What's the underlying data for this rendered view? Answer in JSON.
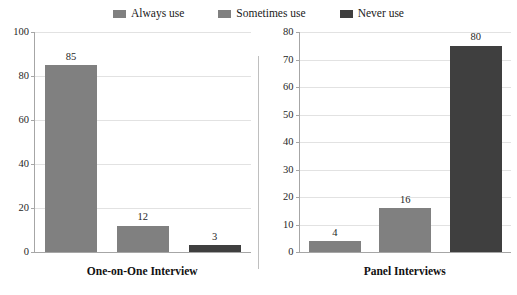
{
  "legend": {
    "items": [
      {
        "label": "Always use",
        "color": "#808080",
        "icon": "legend-swatch-icon"
      },
      {
        "label": "Sometimes use",
        "color": "#808080",
        "icon": "legend-swatch-icon"
      },
      {
        "label": "Never use",
        "color": "#3f3f3f",
        "icon": "legend-swatch-icon"
      }
    ]
  },
  "chart_data": [
    {
      "type": "bar",
      "title": "One-on-One Interview",
      "categories": [
        "Always use",
        "Sometimes use",
        "Never use"
      ],
      "values": [
        85,
        12,
        3
      ],
      "colors": [
        "#808080",
        "#808080",
        "#3f3f3f"
      ],
      "xlabel": "",
      "ylabel": "",
      "ylim": [
        0,
        100
      ],
      "ytick_step": 20,
      "yticks": [
        0,
        20,
        40,
        60,
        80,
        100
      ],
      "ytick_labels": [
        "0",
        "20",
        "40",
        "60",
        "80",
        "100"
      ],
      "data_labels": [
        "85",
        "12",
        "3"
      ],
      "grid": true,
      "legend_position": "top-center"
    },
    {
      "type": "bar",
      "title": "Panel Interviews",
      "categories": [
        "Always use",
        "Sometimes use",
        "Never use"
      ],
      "values": [
        4,
        16,
        80
      ],
      "colors": [
        "#808080",
        "#808080",
        "#3f3f3f"
      ],
      "xlabel": "",
      "ylabel": "",
      "ylim": [
        0,
        80
      ],
      "ytick_step": 10,
      "yticks": [
        0,
        10,
        20,
        30,
        40,
        50,
        60,
        70,
        80
      ],
      "ytick_labels": [
        "0",
        "10",
        "20",
        "30",
        "40",
        "50",
        "60",
        "70",
        "80"
      ],
      "data_labels": [
        "4",
        "16",
        "80"
      ],
      "grid": true,
      "legend_position": "top-center"
    }
  ],
  "colors": {
    "series_light": "#808080",
    "series_dark": "#3f3f3f",
    "gridline": "#e2e2e2",
    "axis": "#a6a6a6",
    "text": "#262626",
    "background": "#ffffff"
  }
}
